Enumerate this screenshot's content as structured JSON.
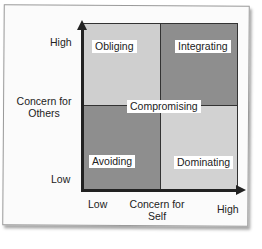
{
  "diagram": {
    "y_axis": {
      "label_line1": "Concern for",
      "label_line2": "Others",
      "high": "High",
      "low": "Low"
    },
    "x_axis": {
      "label_line1": "Concern for",
      "label_line2": "Self",
      "low": "Low",
      "high": "High"
    },
    "quadrants": {
      "top_left": "Obliging",
      "top_right": "Integrating",
      "bottom_left": "Avoiding",
      "bottom_right": "Dominating",
      "center": "Compromising"
    },
    "colors": {
      "light": "#cfcfcf",
      "dark": "#8e8e8e",
      "axis": "#222222"
    }
  }
}
